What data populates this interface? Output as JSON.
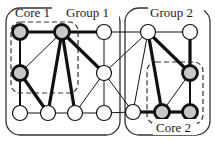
{
  "diagram": {
    "groups": [
      {
        "id": "group1",
        "label": "Group 1",
        "x": 6,
        "y": 8,
        "w": 114,
        "h": 127
      },
      {
        "id": "group2",
        "label": "Group 2",
        "x": 125,
        "y": 8,
        "w": 85,
        "h": 127
      }
    ],
    "cores": [
      {
        "id": "core1",
        "label": "Core 1",
        "x": 11,
        "y": 22,
        "w": 67,
        "h": 71
      },
      {
        "id": "core2",
        "label": "Core 2",
        "x": 147,
        "y": 62,
        "w": 56,
        "h": 62
      }
    ],
    "labels": {
      "group1": "Group 1",
      "group2": "Group 2",
      "core1": "Core 1",
      "core2": "Core 2"
    },
    "nodes": [
      {
        "id": "A",
        "x": 20,
        "y": 32,
        "core": true
      },
      {
        "id": "B",
        "x": 62,
        "y": 32,
        "core": true
      },
      {
        "id": "C",
        "x": 104,
        "y": 32,
        "core": false
      },
      {
        "id": "D",
        "x": 20,
        "y": 73,
        "core": true
      },
      {
        "id": "G",
        "x": 104,
        "y": 73,
        "core": false
      },
      {
        "id": "H",
        "x": 20,
        "y": 113,
        "core": false
      },
      {
        "id": "E",
        "x": 48,
        "y": 113,
        "core": false
      },
      {
        "id": "F",
        "x": 75,
        "y": 113,
        "core": false
      },
      {
        "id": "I",
        "x": 104,
        "y": 113,
        "core": false
      },
      {
        "id": "J",
        "x": 148,
        "y": 32,
        "core": false
      },
      {
        "id": "K",
        "x": 190,
        "y": 32,
        "core": false
      },
      {
        "id": "N",
        "x": 190,
        "y": 73,
        "core": true
      },
      {
        "id": "L",
        "x": 133,
        "y": 112,
        "core": false
      },
      {
        "id": "M",
        "x": 162,
        "y": 112,
        "core": true
      },
      {
        "id": "O",
        "x": 190,
        "y": 112,
        "core": true
      }
    ],
    "edges": [
      {
        "from": "A",
        "to": "B",
        "weight": "thick"
      },
      {
        "from": "B",
        "to": "C",
        "weight": "thick"
      },
      {
        "from": "A",
        "to": "D",
        "weight": "medium"
      },
      {
        "from": "D",
        "to": "B",
        "weight": "thin"
      },
      {
        "from": "B",
        "to": "E",
        "weight": "thick"
      },
      {
        "from": "B",
        "to": "F",
        "weight": "thick"
      },
      {
        "from": "B",
        "to": "G",
        "weight": "thick"
      },
      {
        "from": "D",
        "to": "E",
        "weight": "thick"
      },
      {
        "from": "D",
        "to": "H",
        "weight": "medium"
      },
      {
        "from": "H",
        "to": "E",
        "weight": "thin"
      },
      {
        "from": "E",
        "to": "F",
        "weight": "thin"
      },
      {
        "from": "F",
        "to": "I",
        "weight": "thin"
      },
      {
        "from": "C",
        "to": "G",
        "weight": "thin"
      },
      {
        "from": "G",
        "to": "F",
        "weight": "thin"
      },
      {
        "from": "G",
        "to": "I",
        "weight": "thin"
      },
      {
        "from": "C",
        "to": "J",
        "weight": "thin"
      },
      {
        "from": "J",
        "to": "K",
        "weight": "thin"
      },
      {
        "from": "G",
        "to": "J",
        "weight": "thin"
      },
      {
        "from": "G",
        "to": "L",
        "weight": "thin"
      },
      {
        "from": "I",
        "to": "L",
        "weight": "thin"
      },
      {
        "from": "J",
        "to": "L",
        "weight": "thin"
      },
      {
        "from": "J",
        "to": "M",
        "weight": "thick"
      },
      {
        "from": "J",
        "to": "N",
        "weight": "thick"
      },
      {
        "from": "K",
        "to": "N",
        "weight": "thick"
      },
      {
        "from": "N",
        "to": "M",
        "weight": "thin"
      },
      {
        "from": "N",
        "to": "O",
        "weight": "medium"
      },
      {
        "from": "L",
        "to": "M",
        "weight": "thick"
      },
      {
        "from": "M",
        "to": "O",
        "weight": "thick"
      }
    ],
    "colors": {
      "core_fill": "#c8c8c8",
      "plain_fill": "#ffffff",
      "stroke": "#111111",
      "box": "#333333"
    }
  }
}
